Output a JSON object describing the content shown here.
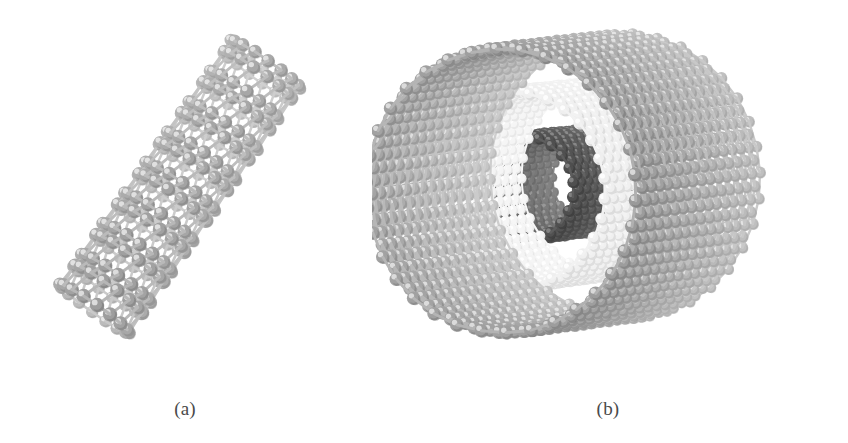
{
  "figure": {
    "background_color": "#ffffff",
    "width": 848,
    "height": 443
  },
  "panels": [
    {
      "id": "a",
      "caption": "(a)",
      "structure_name": "single-walled-carbon-nanotube",
      "description": "Single-walled carbon nanotube, open ended, viewed at an oblique tilt",
      "bounds": {
        "x": 50,
        "y": 33,
        "width": 260,
        "height": 307
      },
      "orientation_deg": -55,
      "tube_axis_length": 300,
      "tube_radius": 42,
      "rings_along_axis": 17,
      "atoms_per_ring": 16,
      "atom_radius": 7.2,
      "bond_width": 3.0,
      "atom_color": "#9d9d9d",
      "atom_highlight_color": "#e8e8e8",
      "atom_shadow_color": "#6f6f6f",
      "bond_color": "#b5b5b5",
      "walls": 1
    },
    {
      "id": "b",
      "caption": "(b)",
      "structure_name": "multi-walled-carbon-nanotube",
      "description": "Multi-walled carbon nanotube viewed nearly end-on, outer gray wall with pale middle wall and dark inner core tube visible through the lattice",
      "bounds": {
        "x": 325,
        "y": 27,
        "width": 475,
        "height": 313
      },
      "orientation_deg": -7,
      "tube_axis_length": 400,
      "walls": 3,
      "wall_layers": [
        {
          "name": "inner-core-tube",
          "radius": 52,
          "rings_along_axis": 22,
          "atoms_per_ring": 22,
          "atom_radius": 6.0,
          "bond_width": 2.4,
          "atom_color": "#4f4f4f",
          "atom_highlight_color": "#8a8a8a",
          "atom_shadow_color": "#2e2e2e",
          "bond_color": "#5d5d5d",
          "axis_length": 250
        },
        {
          "name": "middle-wall-tube",
          "radius": 98,
          "rings_along_axis": 26,
          "atoms_per_ring": 30,
          "atom_radius": 6.4,
          "bond_width": 2.6,
          "atom_color": "#efefef",
          "atom_highlight_color": "#ffffff",
          "atom_shadow_color": "#c4c4c4",
          "bond_color": "#f2f2f2",
          "axis_length": 330
        },
        {
          "name": "outer-wall-tube",
          "radius": 142,
          "rings_along_axis": 30,
          "atoms_per_ring": 34,
          "atom_radius": 7.0,
          "bond_width": 2.9,
          "atom_color": "#9a9a9a",
          "atom_highlight_color": "#e4e4e4",
          "atom_shadow_color": "#6a6a6a",
          "bond_color": "#b0b0b0",
          "axis_length": 400
        }
      ]
    }
  ],
  "render_settings": {
    "light_direction": "top-left",
    "projection": "orthographic",
    "depth_shading": true,
    "depth_fade_strength": 0.45
  }
}
